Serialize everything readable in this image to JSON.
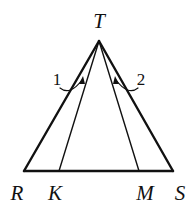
{
  "diagram": {
    "type": "triangle",
    "points": {
      "T": {
        "label": "T",
        "x": 99,
        "y": 41,
        "lx": 99,
        "ly": 28
      },
      "R": {
        "label": "R",
        "x": 24,
        "y": 171,
        "lx": 17,
        "ly": 200
      },
      "K": {
        "label": "K",
        "x": 59,
        "y": 171,
        "lx": 55,
        "ly": 200
      },
      "M": {
        "label": "M",
        "x": 139,
        "y": 171,
        "lx": 145,
        "ly": 200
      },
      "S": {
        "label": "S",
        "x": 173,
        "y": 171,
        "lx": 180,
        "ly": 200
      }
    },
    "segments": [
      "TR",
      "TS",
      "RS",
      "TK",
      "TM"
    ],
    "angles": [
      {
        "label": "1",
        "between": [
          "TR",
          "TK"
        ]
      },
      {
        "label": "2",
        "between": [
          "TM",
          "TS"
        ]
      }
    ],
    "stroke_color": "#111111"
  }
}
